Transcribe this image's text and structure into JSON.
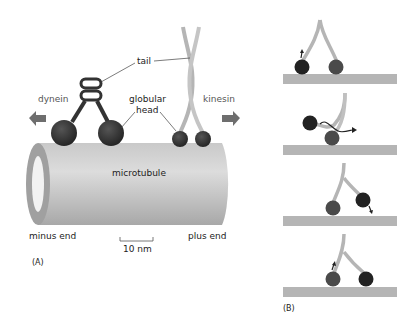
{
  "panel_a": {
    "panel_label": "(A)",
    "labels": {
      "tail": "tail",
      "dynein": "dynein",
      "kinesin": "kinesin",
      "globular": "globular",
      "head": "head",
      "microtubule": "microtubule",
      "minus_end": "minus end",
      "plus_end": "plus end",
      "scale_bar": "10 nm"
    }
  },
  "panel_b": {
    "panel_label": "(B)",
    "steps": 4
  },
  "colors": {
    "head_dark": "#2a2a2a",
    "head_mid": "#4a4a4a",
    "microtubule": "#b8b8b8",
    "track": "#b5b5b5",
    "arrow": "#6e6e6e",
    "stalk": "#b0b0b0"
  }
}
